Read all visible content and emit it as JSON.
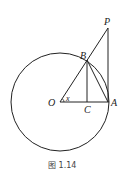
{
  "diagram": {
    "labels": {
      "P": "P",
      "B": "B",
      "O": "O",
      "x": "x",
      "C": "C",
      "A": "A"
    },
    "caption": "图 1.14",
    "colors": {
      "stroke": "#222222",
      "background": "#ffffff"
    }
  }
}
